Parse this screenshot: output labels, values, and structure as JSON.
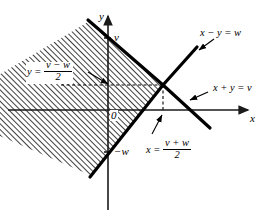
{
  "figure": {
    "type": "math-region-diagram"
  },
  "axes": {
    "x_label": "x",
    "y_label": "y",
    "origin_label": "0"
  },
  "ticks": {
    "y_positive": "v",
    "y_negative": "−w"
  },
  "line_labels": {
    "upper_right": "x − y = w",
    "lower_right": "x + y = v"
  },
  "construction_labels": {
    "horizontal": {
      "lhs": "y =",
      "numerator": "v − w",
      "denominator": "2"
    },
    "vertical": {
      "lhs": "x =",
      "numerator": "v + w",
      "denominator": "2"
    }
  },
  "colors": {
    "ink": "#000000",
    "axis": "#1a1a1a",
    "hatch": "#000000",
    "background": "#ffffff"
  },
  "geometry": {
    "vertex_x": 163,
    "vertex_y": 85,
    "y_axis_x": 108,
    "x_axis_y": 110
  }
}
